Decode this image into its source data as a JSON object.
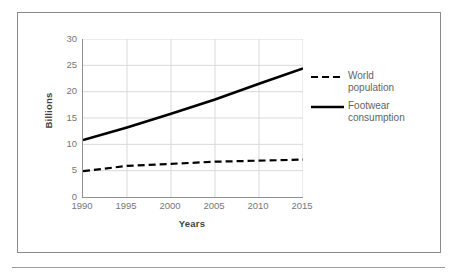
{
  "figure": {
    "border_color": "#8a8a8a",
    "background": "#ffffff"
  },
  "chart_data": {
    "type": "line",
    "title": "",
    "subtitle": "",
    "xlabel": "Years",
    "ylabel": "Billions",
    "x": [
      1990,
      1995,
      2000,
      2005,
      2010,
      2015
    ],
    "xlim": [
      1990,
      2015
    ],
    "ylim": [
      0,
      30
    ],
    "yticks": [
      0,
      5,
      10,
      15,
      20,
      25,
      30
    ],
    "xticks": [
      "1990",
      "1995",
      "2000",
      "2005",
      "2010",
      "2015"
    ],
    "ytick_labels": [
      "30",
      "25",
      "20",
      "15",
      "10",
      "5",
      "0"
    ],
    "grid": true,
    "grid_color": "#d9d9d9",
    "legend_position": "right",
    "series": [
      {
        "name": "World population",
        "label_lines": "World\npopulation",
        "style": "dashed",
        "color": "#000000",
        "width": 2.2,
        "values": [
          4.9,
          5.9,
          6.3,
          6.7,
          6.9,
          7.1
        ]
      },
      {
        "name": "Footwear consumption",
        "label_lines": "Footwear\nconsumption",
        "style": "solid",
        "color": "#000000",
        "width": 2.6,
        "values": [
          10.8,
          13.2,
          15.8,
          18.5,
          21.5,
          24.4
        ]
      }
    ]
  }
}
